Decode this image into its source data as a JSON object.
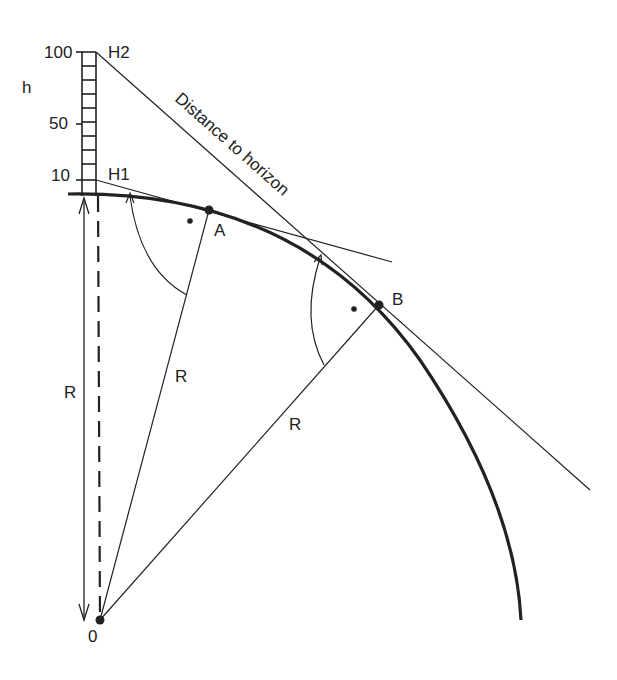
{
  "diagram": {
    "ruler": {
      "axis_label": "h",
      "ticks": [
        {
          "value": "100",
          "label": "100"
        },
        {
          "value": "50",
          "label": "50"
        },
        {
          "value": "10",
          "label": "10"
        }
      ],
      "divisions": 10
    },
    "points": {
      "H1": "H1",
      "H2": "H2",
      "A": "A",
      "B": "B",
      "O": "0"
    },
    "labels": {
      "radius_vertical": "R",
      "radius_A": "R",
      "radius_B": "R",
      "tangent_text": "Distance to horizon"
    },
    "colors": {
      "ink": "#222222",
      "background": "#ffffff"
    }
  }
}
